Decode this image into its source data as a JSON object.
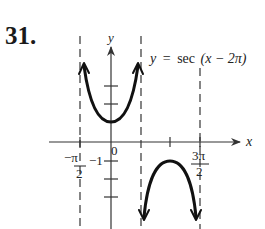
{
  "problem": {
    "number": "31."
  },
  "graph": {
    "equation": "y = sec(x − 2π)",
    "equation_parts": {
      "y": "y",
      "eq": "=",
      "func": "sec",
      "arg": "(x − 2π)"
    },
    "axes": {
      "x_label": "x",
      "y_label": "y"
    },
    "labels": {
      "origin": "0",
      "neg_one": "−1",
      "neg_pi_over_2_num": "−π",
      "neg_pi_over_2_den": "2",
      "three_pi_over_2_num": "3π",
      "three_pi_over_2_den": "2"
    },
    "asymptotes": [
      "-π/2",
      "π/2",
      "3π/2"
    ],
    "branches": [
      {
        "name": "upward branch",
        "vertex": [
          0,
          1
        ],
        "opens": "up"
      },
      {
        "name": "downward branch",
        "vertex": [
          "π",
          -1
        ],
        "opens": "down"
      }
    ],
    "colors": {
      "curve": "#111111",
      "axis": "#333333",
      "asymptote": "#444444"
    }
  }
}
